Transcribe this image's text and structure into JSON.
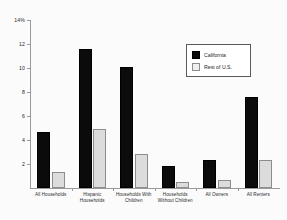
{
  "chart_data": {
    "type": "bar",
    "title": "",
    "subtitle": "",
    "xlabel": "",
    "ylabel": "",
    "ylim": [
      0,
      14
    ],
    "yticks": [
      0,
      2,
      4,
      6,
      8,
      10,
      12,
      14
    ],
    "ytick_labels": [
      "",
      "2",
      "4",
      "6",
      "8",
      "10",
      "12",
      "14%"
    ],
    "grid": false,
    "legend_position": "upper-right-inside",
    "categories": [
      "All Households",
      "Hispanic Households",
      "Households With Children",
      "Households Without Children",
      "All Owners",
      "All Renters"
    ],
    "category_lines": [
      [
        "All Households"
      ],
      [
        "Hispanic",
        "Households"
      ],
      [
        "Households With",
        "Children"
      ],
      [
        "Households",
        "Without Children"
      ],
      [
        "All Owners"
      ],
      [
        "All Renters"
      ]
    ],
    "series": [
      {
        "name": "California",
        "color": "#0b0b0b",
        "values": [
          4.7,
          11.6,
          10.1,
          1.8,
          2.3,
          7.6
        ]
      },
      {
        "name": "Rest of U.S.",
        "color": "#dcdcdc",
        "values": [
          1.3,
          4.9,
          2.8,
          0.5,
          0.7,
          2.35
        ]
      }
    ],
    "annotations": []
  },
  "legend": {
    "items": [
      {
        "label": "California",
        "swatch": "filled-black-square"
      },
      {
        "label": "Rest of U.S.",
        "swatch": "outlined-white-square"
      }
    ]
  },
  "colors": {
    "california": "#0b0b0b",
    "rest_of_us": "#dcdcdc",
    "axis": "#9a9a9a",
    "text": "#2a2a2a",
    "background": "#fbfbfb"
  }
}
